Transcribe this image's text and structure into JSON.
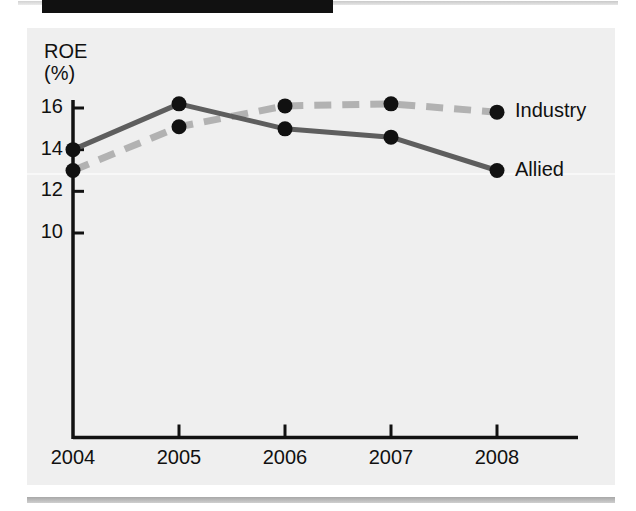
{
  "page": {
    "top_bar": {
      "name": "redacted-title-bar"
    },
    "bottom_rule": {
      "name": "footer-rule"
    }
  },
  "chart_data": {
    "type": "line",
    "title": "",
    "subtitle": "",
    "xlabel": "",
    "ylabel": "ROE",
    "ylabel_units": "(%)",
    "ylabel_full": "ROE (%)",
    "categories": [
      "2004",
      "2005",
      "2006",
      "2007",
      "2008"
    ],
    "x": [
      2004,
      2005,
      2006,
      2007,
      2008
    ],
    "yticks": [
      16,
      14,
      12,
      10
    ],
    "ylim": [
      8.6,
      17.4
    ],
    "grid": false,
    "legend_position": "right-inline",
    "series": [
      {
        "name": "Industry",
        "values": [
          13.0,
          15.1,
          16.1,
          16.2,
          15.8
        ],
        "style": "dashed",
        "color": "#b2b2b2",
        "marker_color": "#111111"
      },
      {
        "name": "Allied",
        "values": [
          14.0,
          16.2,
          15.0,
          14.6,
          13.0
        ],
        "style": "solid",
        "color": "#5e5e5e",
        "marker_color": "#111111"
      }
    ],
    "axis_color": "#111111",
    "plot_background": "#efefef"
  },
  "labels": {
    "y_ticks": [
      "16",
      "14",
      "12",
      "10"
    ],
    "x_ticks": [
      "2004",
      "2005",
      "2006",
      "2007",
      "2008"
    ],
    "legend": [
      "Industry",
      "Allied"
    ],
    "axis_title_line1": "ROE",
    "axis_title_line2": "(%)"
  }
}
